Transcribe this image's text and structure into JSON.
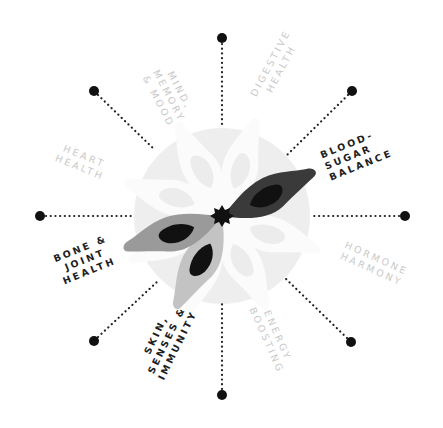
{
  "diagram": {
    "center": {
      "x": 222,
      "y": 216
    },
    "circle": {
      "radius": 88,
      "color": "#eeeeee"
    },
    "colors": {
      "white_petal": "#fbfbfb",
      "white_petal_inner": "#eeeeee",
      "dark_petal": "#3a3a3a",
      "medium_petal": "#9a9a9a",
      "light_petal": "#c3c3c3",
      "petal_core": "#111111",
      "dot": "#111111",
      "active_label": "#1e1e1e",
      "inactive_label": "#c9c9c9"
    },
    "spokes": [
      {
        "angle": -90,
        "dot": {
          "x": 222,
          "y": 38
        }
      },
      {
        "angle": -45,
        "dot": {
          "x": 352,
          "y": 91
        }
      },
      {
        "angle": 0,
        "dot": {
          "x": 405,
          "y": 216
        }
      },
      {
        "angle": 45,
        "dot": {
          "x": 351,
          "y": 342
        }
      },
      {
        "angle": 90,
        "dot": {
          "x": 222,
          "y": 395
        }
      },
      {
        "angle": 135,
        "dot": {
          "x": 94,
          "y": 341
        }
      },
      {
        "angle": 180,
        "dot": {
          "x": 40,
          "y": 216
        }
      },
      {
        "angle": -135,
        "dot": {
          "x": 94,
          "y": 91
        }
      }
    ],
    "highlighted_petals": [
      {
        "name": "blood-sugar-balance",
        "angle": -22,
        "shade": "dark"
      },
      {
        "name": "bone-joint-health",
        "angle": 200,
        "shade": "medium"
      },
      {
        "name": "skin-senses-immunity",
        "angle": 247,
        "shade": "light"
      }
    ],
    "center_star": {
      "points": 9,
      "color": "#111111"
    }
  },
  "labels": [
    {
      "id": "mind",
      "text": "MIND,\nMEMORY\n& MOOD",
      "active": false
    },
    {
      "id": "digestive",
      "text": "DIGESTIVE\nHEALTH",
      "active": false
    },
    {
      "id": "blood_sugar",
      "text": "BLOOD-\nSUGAR\nBALANCE",
      "active": true
    },
    {
      "id": "hormone",
      "text": "HORMONE\nHARMONY",
      "active": false
    },
    {
      "id": "energy",
      "text": "ENERGY\nBOOSTING",
      "active": false
    },
    {
      "id": "skin",
      "text": "SKIN,\nSENSES &\nIMMUNITY",
      "active": true
    },
    {
      "id": "bone",
      "text": "BONE &\nJOINT\nHEALTH",
      "active": true
    },
    {
      "id": "heart",
      "text": "HEART\nHEALTH",
      "active": false
    }
  ]
}
